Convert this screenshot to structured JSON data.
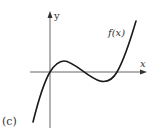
{
  "figure": {
    "panel_label": "(c)",
    "function_label": "f(x)",
    "x_axis_label": "x",
    "y_axis_label": "y",
    "colors": {
      "curve": "#1a1a1a",
      "axis": "#666666",
      "text": "#333333",
      "background": "#ffffff"
    },
    "curve": {
      "description": "cubic with local max just right of origin, local min further right, passing through origin and crossing x-axis again",
      "passes_through_origin": true,
      "local_max": "above x-axis, right of y-axis",
      "local_min": "below x-axis",
      "end_behavior": "falls to -infinity on left, rises to +infinity on right"
    }
  }
}
